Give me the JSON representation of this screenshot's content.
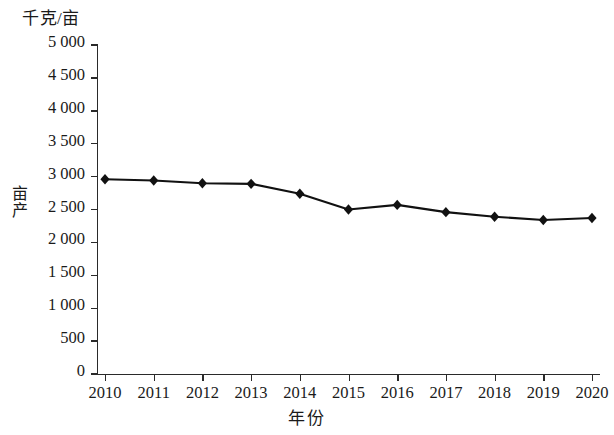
{
  "chart_data": {
    "type": "line",
    "title": "",
    "unit_label": "千克/亩",
    "xlabel": "年份",
    "ylabel": "亩产",
    "categories": [
      "2010",
      "2011",
      "2012",
      "2013",
      "2014",
      "2015",
      "2016",
      "2017",
      "2018",
      "2019",
      "2020"
    ],
    "x": [
      2010,
      2011,
      2012,
      2013,
      2014,
      2015,
      2016,
      2017,
      2018,
      2019,
      2020
    ],
    "values": [
      2960,
      2940,
      2900,
      2890,
      2740,
      2500,
      2570,
      2460,
      2390,
      2340,
      2370
    ],
    "series": [
      {
        "name": "亩产",
        "values": [
          2960,
          2940,
          2900,
          2890,
          2740,
          2500,
          2570,
          2460,
          2390,
          2340,
          2370
        ]
      }
    ],
    "ylim": [
      0,
      5000
    ],
    "ytick_values": [
      0,
      500,
      1000,
      1500,
      2000,
      2500,
      3000,
      3500,
      4000,
      4500,
      5000
    ],
    "ytick_labels": [
      "0",
      "500",
      "1 000",
      "1 500",
      "2 000",
      "2 500",
      "3 000",
      "3 500",
      "4 000",
      "4 500",
      "5 000"
    ],
    "grid": false,
    "legend": "none",
    "marker": "diamond",
    "line_color": "#111111",
    "marker_color": "#111111",
    "background_color": "#ffffff"
  }
}
